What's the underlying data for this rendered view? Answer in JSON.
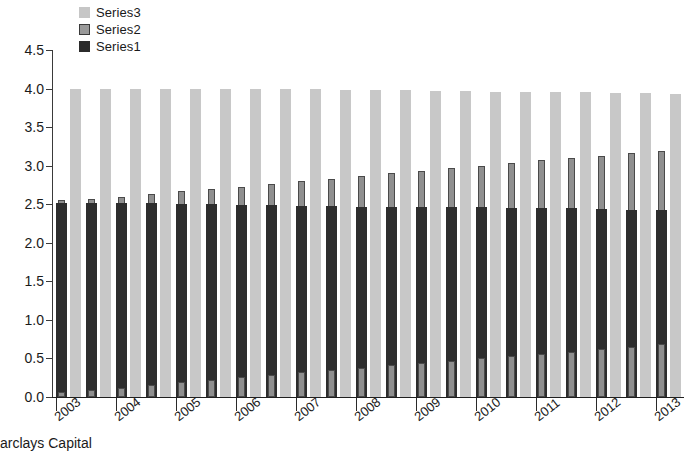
{
  "chart_data": {
    "type": "bar",
    "title": "",
    "subtitle": "",
    "xlabel": "",
    "ylabel": "",
    "ylim": [
      0.0,
      4.5
    ],
    "ytick_labels": [
      "4.5",
      "4.0",
      "3.5",
      "3.0",
      "2.5",
      "2.0",
      "1.5",
      "1.0",
      "0.5",
      "0.0"
    ],
    "ytick_values": [
      4.5,
      4.0,
      3.5,
      3.0,
      2.5,
      2.0,
      1.5,
      1.0,
      0.5,
      0.0
    ],
    "grid": false,
    "legend_position": "top-left",
    "categories": [
      "2003",
      "2003",
      "2004",
      "2004",
      "2005",
      "2005",
      "2006",
      "2006",
      "2007",
      "2007",
      "2008",
      "2008",
      "2009",
      "2009",
      "2010",
      "2010",
      "2011",
      "2011",
      "2012",
      "2012",
      "2013"
    ],
    "xtick_labels": [
      "2003",
      "2004",
      "2005",
      "2006",
      "2007",
      "2008",
      "2009",
      "2010",
      "2011",
      "2012",
      "2013"
    ],
    "series": [
      {
        "name": "Series3",
        "color": "#c8c8c8",
        "values": [
          4.0,
          4.0,
          4.0,
          4.0,
          4.0,
          4.0,
          3.99,
          3.99,
          3.99,
          3.98,
          3.98,
          3.98,
          3.97,
          3.97,
          3.96,
          3.96,
          3.95,
          3.95,
          3.94,
          3.94,
          3.93
        ]
      },
      {
        "name": "Series2",
        "color": "#8f8f8f",
        "values": [
          2.55,
          2.57,
          2.6,
          2.63,
          2.67,
          2.7,
          2.73,
          2.76,
          2.8,
          2.83,
          2.87,
          2.9,
          2.93,
          2.97,
          3.0,
          3.04,
          3.07,
          3.1,
          3.13,
          3.16,
          3.19
        ]
      },
      {
        "name": "Series1",
        "color": "#2d2d2d",
        "values": [
          2.52,
          2.52,
          2.51,
          2.51,
          2.5,
          2.5,
          2.49,
          2.49,
          2.48,
          2.48,
          2.47,
          2.47,
          2.46,
          2.46,
          2.46,
          2.45,
          2.45,
          2.45,
          2.44,
          2.43,
          2.42
        ]
      },
      {
        "name": "Series2_base",
        "color": "#8f8f8f",
        "values": [
          0.06,
          0.09,
          0.12,
          0.15,
          0.19,
          0.22,
          0.26,
          0.29,
          0.32,
          0.35,
          0.38,
          0.41,
          0.44,
          0.47,
          0.5,
          0.53,
          0.56,
          0.59,
          0.62,
          0.65,
          0.69
        ]
      }
    ]
  },
  "legend": {
    "items": [
      {
        "label": "Series3",
        "swatch": "light-gray"
      },
      {
        "label": "Series2",
        "swatch": "medium-gray"
      },
      {
        "label": "Series1",
        "swatch": "dark-gray"
      }
    ]
  },
  "caption": {
    "text": "arclays Capital"
  }
}
